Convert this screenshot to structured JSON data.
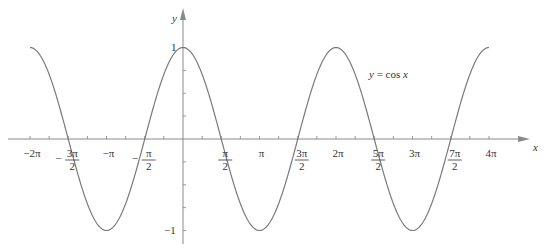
{
  "chart_data": {
    "type": "line",
    "title": "",
    "annotation": "y = cos x",
    "xlabel": "x",
    "ylabel": "y",
    "xlim_radians": [
      -6.2832,
      12.5664
    ],
    "ylim": [
      -1,
      1
    ],
    "grid": false,
    "legend": null,
    "series": [
      {
        "name": "y = cos x",
        "function": "cos(x)",
        "color": "#7a7a7a"
      }
    ],
    "x_ticks": [
      {
        "value": -6.2832,
        "label": "−2π"
      },
      {
        "value": -4.7124,
        "label": "−3π/2"
      },
      {
        "value": -3.1416,
        "label": "−π"
      },
      {
        "value": -1.5708,
        "label": "−π/2"
      },
      {
        "value": 1.5708,
        "label": "π/2"
      },
      {
        "value": 3.1416,
        "label": "π"
      },
      {
        "value": 4.7124,
        "label": "3π/2"
      },
      {
        "value": 6.2832,
        "label": "2π"
      },
      {
        "value": 7.854,
        "label": "5π/2"
      },
      {
        "value": 9.4248,
        "label": "3π"
      },
      {
        "value": 10.9956,
        "label": "7π/2"
      },
      {
        "value": 12.5664,
        "label": "4π"
      }
    ],
    "y_ticks": [
      {
        "value": 1,
        "label": "1"
      },
      {
        "value": -1,
        "label": "−1"
      }
    ]
  },
  "labels": {
    "x_axis": "x",
    "y_axis": "y",
    "annotation": "y = cos x",
    "y_one": "1",
    "y_neg_one": "−1"
  },
  "layout": {
    "origin_x": 183,
    "origin_y": 139,
    "px_per_pi": 76.5,
    "px_per_unit_y": 91.5,
    "curve_color": "#7a7a7a",
    "axis_color": "#8a8a8a"
  }
}
